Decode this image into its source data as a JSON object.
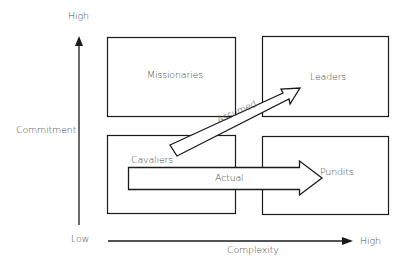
{
  "diagram": {
    "axes": {
      "y": {
        "label": "Commitment",
        "high": "High",
        "low": "Low"
      },
      "x": {
        "label": "Complexity",
        "high": "High"
      }
    },
    "quadrants": [
      {
        "id": "top-left",
        "label": "Missionaries"
      },
      {
        "id": "top-right",
        "label": "Leaders"
      },
      {
        "id": "bottom-left",
        "label": "Cavaliers"
      },
      {
        "id": "bottom-right",
        "label": "Pundits"
      }
    ],
    "arrows": [
      {
        "label": "Assumed",
        "from": "Cavaliers",
        "to": "Leaders"
      },
      {
        "label": "Actual",
        "from": "Cavaliers",
        "to": "Pundits"
      }
    ],
    "colors": {
      "stroke": "#1a1a1a",
      "text": "#4a4a4a",
      "background": "#ffffff"
    }
  }
}
